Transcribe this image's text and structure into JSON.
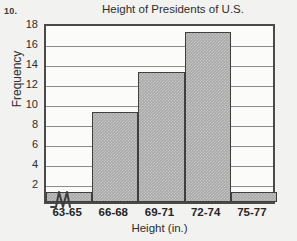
{
  "problem_number": "10.",
  "chart_data": {
    "type": "bar",
    "title": "Height of Presidents of U.S.",
    "xlabel": "Height (in.)",
    "ylabel": "Frequency",
    "categories": [
      "63-65",
      "66-68",
      "69-71",
      "72-74",
      "75-77"
    ],
    "values": [
      1,
      9,
      13,
      17,
      1
    ],
    "ylim": [
      0,
      18
    ],
    "ytick_labels": [
      "2",
      "4",
      "6",
      "8",
      "10",
      "12",
      "14",
      "16",
      "18"
    ],
    "ytick_values": [
      2,
      4,
      6,
      8,
      10,
      12,
      14,
      16,
      18
    ],
    "grid": true,
    "legend": "none",
    "annotations": [
      "x-axis break symbol between origin and first bin"
    ],
    "bar_fill_color": "#a9a9a9",
    "bar_edge_color": "#3f3f3f",
    "axis_color": "#4a4a4a",
    "grid_color": "#8d8d8d",
    "background_color": "#f2f2f0"
  }
}
